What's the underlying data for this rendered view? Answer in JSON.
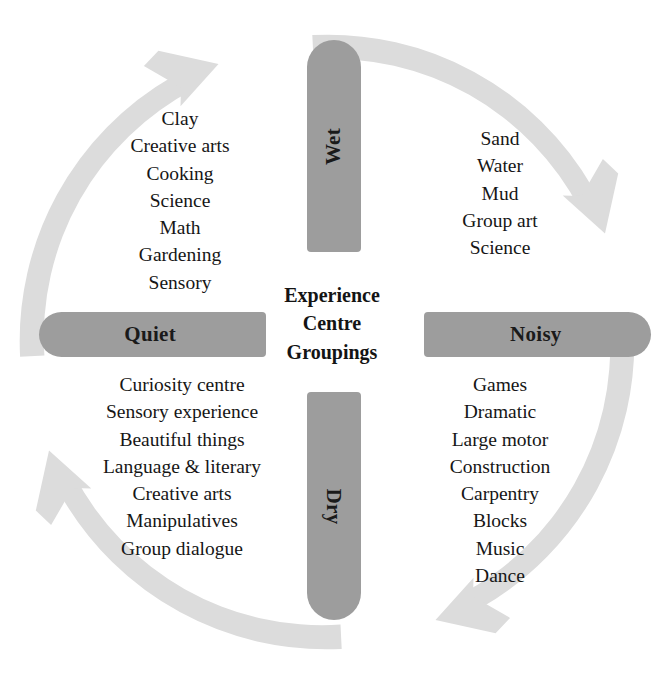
{
  "centre": {
    "line1": "Experience",
    "line2": "Centre",
    "line3": "Groupings"
  },
  "axes": {
    "wet": "Wet",
    "dry": "Dry",
    "quiet": "Quiet",
    "noisy": "Noisy"
  },
  "quadrants": {
    "wet_quiet": {
      "name": "Wet / Quiet",
      "items": [
        "Clay",
        "Creative arts",
        "Cooking",
        "Science",
        "Math",
        "Gardening",
        "Sensory"
      ]
    },
    "wet_noisy": {
      "name": "Wet / Noisy",
      "items": [
        "Sand",
        "Water",
        "Mud",
        "Group art",
        "Science"
      ]
    },
    "dry_quiet": {
      "name": "Dry / Quiet",
      "items": [
        "Curiosity centre",
        "Sensory experience",
        "Beautiful things",
        "Language & literary",
        "Creative arts",
        "Manipulatives",
        "Group dialogue"
      ]
    },
    "dry_noisy": {
      "name": "Dry / Noisy",
      "items": [
        "Games",
        "Dramatic",
        "Large motor",
        "Construction",
        "Carpentry",
        "Blocks",
        "Music",
        "Dance"
      ]
    }
  },
  "colors": {
    "bar_gray": "#9d9d9d",
    "arrow_gray": "#dcdcdc",
    "text_black": "#161616",
    "background": "#ffffff"
  },
  "icons": {
    "ring": "circular-arrow-ring",
    "arrowheads": [
      "arrowhead-top-left",
      "arrowhead-top-right",
      "arrowhead-bottom-left",
      "arrowhead-bottom-right",
      "arrowhead-left-upper",
      "arrowhead-left-lower",
      "arrowhead-right-upper",
      "arrowhead-right-lower"
    ]
  }
}
